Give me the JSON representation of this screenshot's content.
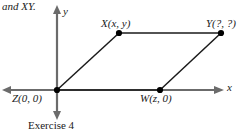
{
  "figure": {
    "intro_text": "and XY.",
    "caption": "Exercise 4",
    "axes": {
      "x_label": "x",
      "y_label": "y",
      "axis_color": "#6b6b6b"
    },
    "shape": {
      "name": "parallelogram",
      "edge_color": "#1a1a1a",
      "point_color": "#000000"
    },
    "vertices": [
      {
        "id": "X",
        "label": "X(x, y)",
        "px": 119,
        "py": 33
      },
      {
        "id": "Y",
        "label": "Y(?, ?)",
        "px": 221,
        "py": 33
      },
      {
        "id": "Z",
        "label": "Z(0, 0)",
        "px": 57,
        "py": 90
      },
      {
        "id": "W",
        "label": "W(z, 0)",
        "px": 160,
        "py": 90
      }
    ]
  }
}
